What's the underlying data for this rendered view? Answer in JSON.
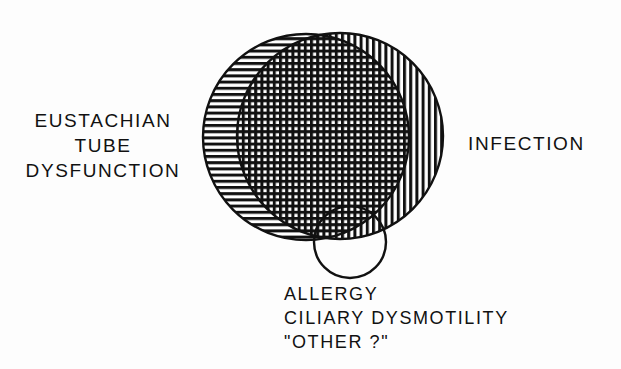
{
  "diagram": {
    "type": "venn",
    "title": "",
    "background_color": "#fdfdfd",
    "stroke_color": "#111111",
    "sets": [
      {
        "id": "eustachian-tube-dysfunction",
        "label_lines": [
          "EUSTACHIAN",
          "TUBE",
          "DYSFUNCTION"
        ],
        "shape": "circle",
        "fill_pattern": "horizontal-hatch",
        "center": [
          306,
          137
        ],
        "radius": 103
      },
      {
        "id": "infection",
        "label_lines": [
          "INFECTION"
        ],
        "shape": "circle",
        "fill_pattern": "vertical-hatch",
        "center": [
          340,
          136
        ],
        "radius": 103
      },
      {
        "id": "allergy-ciliary-other",
        "label_lines": [
          "ALLERGY",
          "CILIARY DYSMOTILITY",
          "\"OTHER ?\""
        ],
        "shape": "circle",
        "fill_pattern": "none",
        "center": [
          350,
          242
        ],
        "radius": 36
      }
    ],
    "intersection": {
      "id": "etd-infection-overlap",
      "fill_pattern": "cross-hatch"
    }
  },
  "labels": {
    "left": {
      "line1": "EUSTACHIAN",
      "line2": "TUBE",
      "line3": "DYSFUNCTION"
    },
    "right": {
      "line1": "INFECTION"
    },
    "bottom": {
      "line1": "ALLERGY",
      "line2": "CILIARY DYSMOTILITY",
      "line3": "\"OTHER ?\""
    }
  }
}
